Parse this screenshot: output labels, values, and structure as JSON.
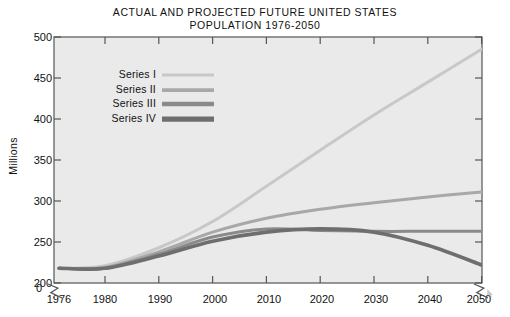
{
  "chart_data": {
    "type": "line",
    "title": "ACTUAL AND PROJECTED FUTURE UNITED STATES POPULATION 1976-2050",
    "title_line1": "ACTUAL AND PROJECTED FUTURE UNITED STATES",
    "title_line2": "POPULATION 1976-2050",
    "xlabel": "",
    "ylabel": "Millions",
    "ylim": [
      0,
      500
    ],
    "y_axis_break": true,
    "y_break_between": [
      0,
      200
    ],
    "x_axis_break": true,
    "grid": false,
    "legend_position": "upper-left-inside",
    "y_ticks": [
      500,
      450,
      400,
      350,
      300,
      250,
      200,
      0
    ],
    "y_tick_labels": [
      "500",
      "450",
      "400",
      "350",
      "300",
      "250",
      "200",
      "0"
    ],
    "x_ticks": [
      1976,
      1980,
      1990,
      2000,
      2010,
      2020,
      2030,
      2040,
      2050
    ],
    "x_tick_labels": [
      "1976",
      "1980",
      "1990",
      "2000",
      "2010",
      "2020",
      "2030",
      "2040",
      "2050"
    ],
    "x": [
      1976,
      1980,
      1990,
      2000,
      2010,
      2020,
      2030,
      2040,
      2050
    ],
    "series": [
      {
        "name": "Series I",
        "color": "#c8c8c8",
        "width": 3.0,
        "values": [
          218,
          221,
          243,
          275,
          318,
          362,
          405,
          445,
          485
        ]
      },
      {
        "name": "Series II",
        "color": "#a8a8a8",
        "width": 3.0,
        "values": [
          218,
          219,
          238,
          262,
          279,
          290,
          298,
          305,
          311
        ]
      },
      {
        "name": "Series III",
        "color": "#8a8a8a",
        "width": 3.0,
        "values": [
          218,
          218,
          235,
          256,
          266,
          264,
          263,
          263,
          263
        ]
      },
      {
        "name": "Series IV",
        "color": "#6e6e6e",
        "width": 3.6,
        "values": [
          218,
          218,
          233,
          251,
          262,
          266,
          262,
          246,
          222
        ]
      }
    ],
    "plot_background": "#eaeaea",
    "axis_color": "#555555",
    "text_color": "#111111",
    "page_background": "#ffffff"
  },
  "legend": {
    "items": [
      {
        "label": "Series I"
      },
      {
        "label": "Series II"
      },
      {
        "label": "Series III"
      },
      {
        "label": "Series IV"
      }
    ]
  },
  "axes": {
    "y_axis_title": "Millions"
  }
}
